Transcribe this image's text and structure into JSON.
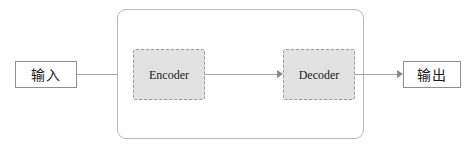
{
  "diagram": {
    "colors": {
      "module_fill": "#e2e2e2",
      "module_border": "#9a9a9a",
      "container_border": "#b9b9b9",
      "io_border": "#8e8e8e",
      "connector": "#a5a5a5",
      "arrowhead": "#8a8a8a",
      "background": "#ffffff",
      "text": "#1a1a1a"
    },
    "input_node": {
      "label": "输入"
    },
    "output_node": {
      "label": "输出"
    },
    "container": {
      "label": ""
    },
    "modules": [
      {
        "id": "encoder",
        "label": "Encoder"
      },
      {
        "id": "decoder",
        "label": "Decoder"
      }
    ],
    "connectors": [
      {
        "id": "input-to-encoder",
        "from": "输入",
        "to": "Encoder",
        "label": ""
      },
      {
        "id": "encoder-to-decoder",
        "from": "Encoder",
        "to": "Decoder",
        "label": ""
      },
      {
        "id": "decoder-to-output",
        "from": "Decoder",
        "to": "输出",
        "label": ""
      }
    ]
  }
}
